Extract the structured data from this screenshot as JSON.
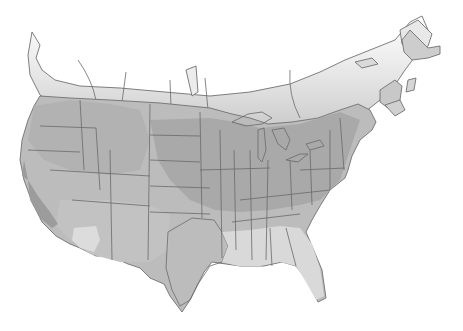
{
  "map": {
    "subject": "Contiguous United States and southern Canada, grayscale shaded relief/zone map",
    "colors": {
      "background": "#ffffff",
      "land_dark": "#a9a9a9",
      "land_mid": "#bdbdbd",
      "land_light": "#dcdcdc",
      "canada_fade": "#e6e6e6",
      "water_lakes": "#f2f2f2",
      "borders": "#6a6a6a"
    },
    "regions": [
      {
        "name": "canada-south-band",
        "shade": "light-gradient"
      },
      {
        "name": "northwest-us",
        "shade": "mid"
      },
      {
        "name": "midwest-us",
        "shade": "dark"
      },
      {
        "name": "northeast-us",
        "shade": "dark"
      },
      {
        "name": "southeast-us",
        "shade": "light"
      },
      {
        "name": "texas-gulf",
        "shade": "light"
      },
      {
        "name": "california-valley",
        "shade": "dark"
      },
      {
        "name": "southwest-us",
        "shade": "mid"
      },
      {
        "name": "great-lakes",
        "shade": "water"
      }
    ]
  }
}
